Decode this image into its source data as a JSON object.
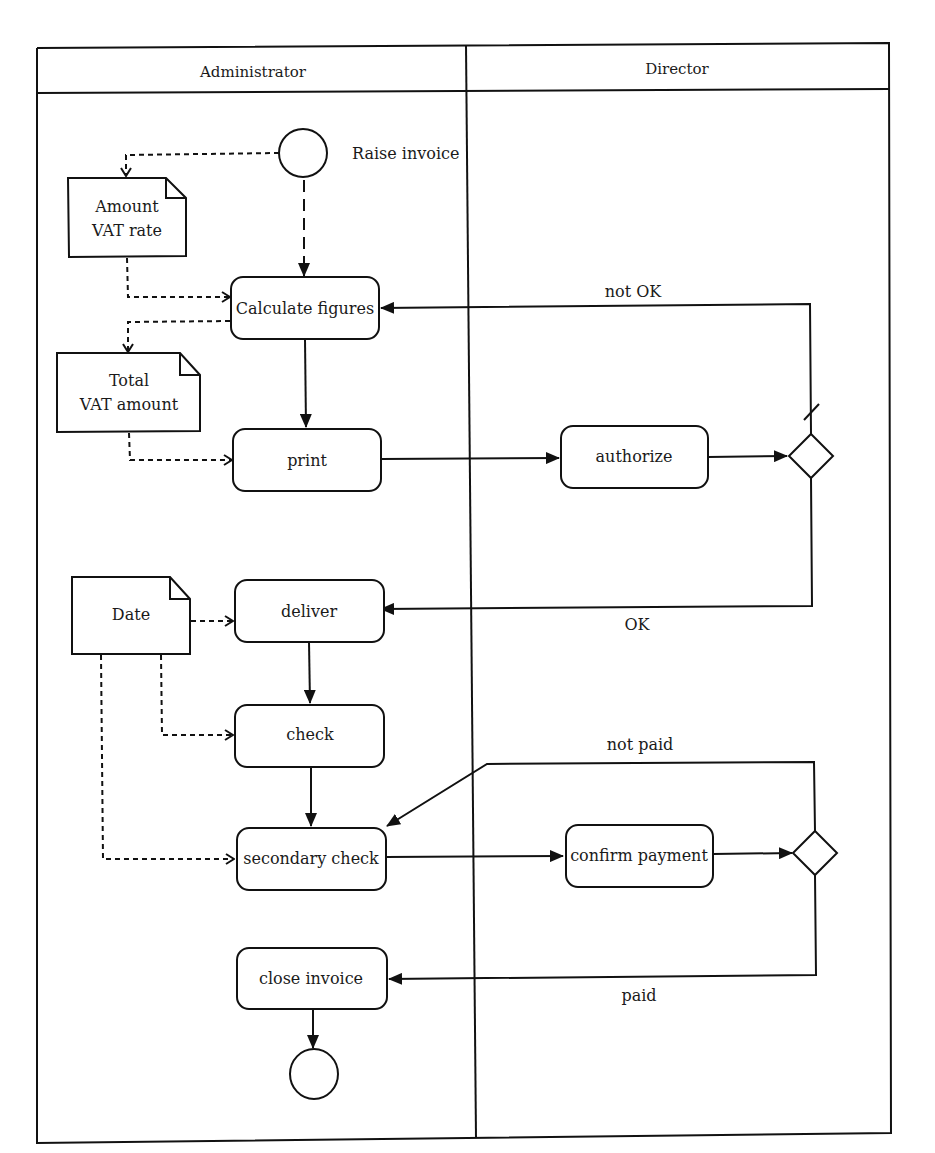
{
  "diagram": {
    "type": "uml-activity-swimlane",
    "lanes": [
      {
        "label": "Administrator"
      },
      {
        "label": "Director"
      }
    ],
    "start": {
      "label": "Raise invoice"
    },
    "objects": {
      "amount_vat": {
        "line1": "Amount",
        "line2": "VAT rate"
      },
      "total_vat": {
        "line1": "Total",
        "line2": "VAT amount"
      },
      "date": {
        "label": "Date"
      }
    },
    "actions": {
      "calculate": "Calculate figures",
      "print": "print",
      "authorize": "authorize",
      "deliver": "deliver",
      "check": "check",
      "secondary_check": "secondary check",
      "confirm_payment": "confirm payment",
      "close_invoice": "close invoice"
    },
    "guards": {
      "not_ok": "not OK",
      "ok": "OK",
      "not_paid": "not paid",
      "paid": "paid"
    }
  }
}
